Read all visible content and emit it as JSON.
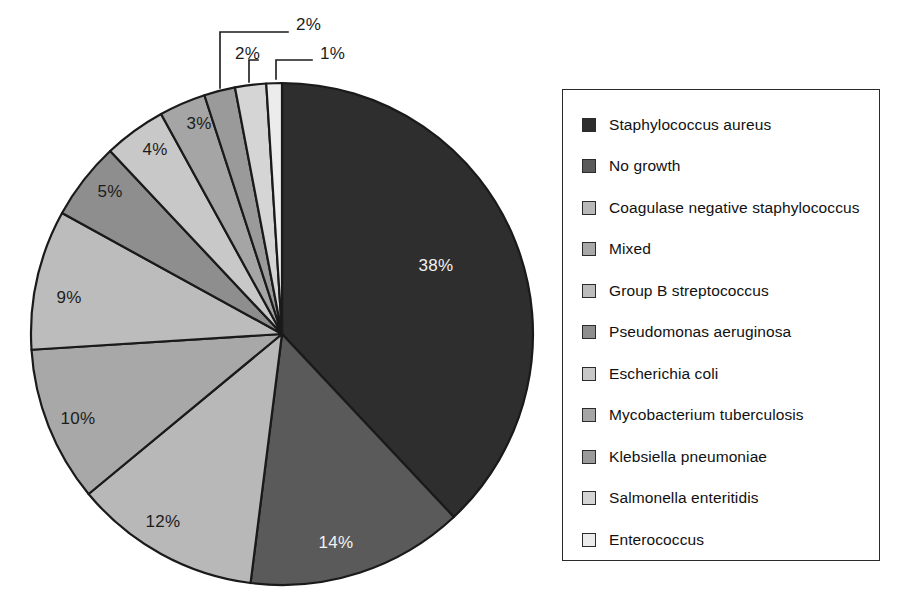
{
  "chart_data": {
    "type": "pie",
    "title": "",
    "subtitle": "",
    "xlabel": "",
    "ylabel": "",
    "grid": false,
    "legend_position": "right",
    "units": "percent",
    "start_angle_deg": 0,
    "direction": "clockwise",
    "labels": [
      "Staphylococcus aureus",
      "No growth",
      "Coagulase negative staphylococcus",
      "Mixed",
      "Group B streptococcus",
      "Pseudomonas aeruginosa",
      "Escherichia coli",
      "Mycobacterium tuberculosis",
      "Klebsiella pneumoniae",
      "Salmonella enteritidis",
      "Enterococcus"
    ],
    "values": [
      38,
      14,
      12,
      10,
      9,
      5,
      4,
      3,
      2,
      2,
      1
    ],
    "value_labels": [
      "38%",
      "14%",
      "12%",
      "10%",
      "9%",
      "5%",
      "4%",
      "3%",
      "2%",
      "2%",
      "1%"
    ],
    "colors": [
      "#2e2e2e",
      "#5a5a5a",
      "#b8b8b8",
      "#a8a8a8",
      "#bcbcbc",
      "#8e8e8e",
      "#c8c8c8",
      "#a5a5a5",
      "#9a9a9a",
      "#d5d5d5",
      "#ececec"
    ],
    "label_text_colors": [
      "light",
      "light",
      "dark",
      "dark",
      "dark",
      "dark",
      "dark",
      "dark",
      "dark",
      "dark",
      "dark"
    ],
    "callout_slices": [
      "Klebsiella pneumoniae",
      "Salmonella enteritidis",
      "Enterococcus"
    ],
    "callout_value_labels": [
      "2%",
      "2%",
      "1%"
    ]
  },
  "pie": {
    "center_x": 282,
    "center_y": 334,
    "radius": 251,
    "slices": [
      {
        "name": "Staphylococcus aureus",
        "value_label": "38%",
        "color": "#2e2e2e",
        "text_class": "light",
        "start_deg": 0,
        "end_deg": 136.8,
        "label_x": 436,
        "label_y": 271,
        "callout": false
      },
      {
        "name": "No growth",
        "value_label": "14%",
        "color": "#5a5a5a",
        "text_class": "light",
        "start_deg": 136.8,
        "end_deg": 187.2,
        "label_x": 336,
        "label_y": 548,
        "callout": false
      },
      {
        "name": "Coagulase negative staphylococcus",
        "value_label": "12%",
        "color": "#b8b8b8",
        "text_class": "dark",
        "start_deg": 187.2,
        "end_deg": 230.4,
        "label_x": 163,
        "label_y": 527,
        "callout": false
      },
      {
        "name": "Mixed",
        "value_label": "10%",
        "color": "#a8a8a8",
        "text_class": "dark",
        "start_deg": 230.4,
        "end_deg": 266.4,
        "label_x": 78,
        "label_y": 424,
        "callout": false
      },
      {
        "name": "Group B streptococcus",
        "value_label": "9%",
        "color": "#bcbcbc",
        "text_class": "dark",
        "start_deg": 266.4,
        "end_deg": 298.8,
        "label_x": 69,
        "label_y": 303,
        "callout": false
      },
      {
        "name": "Pseudomonas aeruginosa",
        "value_label": "5%",
        "color": "#8e8e8e",
        "text_class": "dark",
        "start_deg": 298.8,
        "end_deg": 316.8,
        "label_x": 110,
        "label_y": 197,
        "callout": false
      },
      {
        "name": "Escherichia coli",
        "value_label": "4%",
        "color": "#c8c8c8",
        "text_class": "dark",
        "start_deg": 316.8,
        "end_deg": 331.2,
        "label_x": 155,
        "label_y": 155,
        "callout": false
      },
      {
        "name": "Mycobacterium tuberculosis",
        "value_label": "3%",
        "color": "#a5a5a5",
        "text_class": "dark",
        "start_deg": 331.2,
        "end_deg": 342.0,
        "label_x": 199,
        "label_y": 129,
        "callout": false
      },
      {
        "name": "Klebsiella pneumoniae",
        "value_label": "2%",
        "color": "#9a9a9a",
        "text_class": "dark",
        "start_deg": 342.0,
        "end_deg": 349.2,
        "label_x": 0,
        "label_y": 0,
        "callout": true
      },
      {
        "name": "Salmonella enteritidis",
        "value_label": "2%",
        "color": "#d5d5d5",
        "text_class": "dark",
        "start_deg": 349.2,
        "end_deg": 356.4,
        "label_x": 0,
        "label_y": 0,
        "callout": true
      },
      {
        "name": "Enterococcus",
        "value_label": "1%",
        "color": "#ececec",
        "text_class": "dark",
        "start_deg": 356.4,
        "end_deg": 360.0,
        "label_x": 0,
        "label_y": 0,
        "callout": true
      }
    ],
    "callouts": [
      {
        "name": "Klebsiella pneumoniae",
        "value_label": "2%",
        "text_x": 296,
        "text_y": 18,
        "path": "M 220 88 L 220 32 L 288 32"
      },
      {
        "name": "Salmonella enteritidis",
        "value_label": "2%",
        "text_x": 235,
        "text_y": 47,
        "path": "M 249 82 L 249 60 L 258 60"
      },
      {
        "name": "Enterococcus",
        "value_label": "1%",
        "text_x": 320,
        "text_y": 47,
        "path": "M 276 79 L 276 60 L 312 60"
      }
    ]
  },
  "legend": {
    "items": [
      {
        "label": "Staphylococcus aureus",
        "color": "#2e2e2e"
      },
      {
        "label": "No growth",
        "color": "#5a5a5a"
      },
      {
        "label": "Coagulase negative staphylococcus",
        "color": "#b8b8b8"
      },
      {
        "label": "Mixed",
        "color": "#a8a8a8"
      },
      {
        "label": "Group B streptococcus",
        "color": "#bcbcbc"
      },
      {
        "label": "Pseudomonas aeruginosa",
        "color": "#8e8e8e"
      },
      {
        "label": "Escherichia coli",
        "color": "#c8c8c8"
      },
      {
        "label": "Mycobacterium tuberculosis",
        "color": "#a5a5a5"
      },
      {
        "label": "Klebsiella pneumoniae",
        "color": "#9a9a9a"
      },
      {
        "label": "Salmonella enteritidis",
        "color": "#d5d5d5"
      },
      {
        "label": "Enterococcus",
        "color": "#ececec"
      }
    ]
  }
}
